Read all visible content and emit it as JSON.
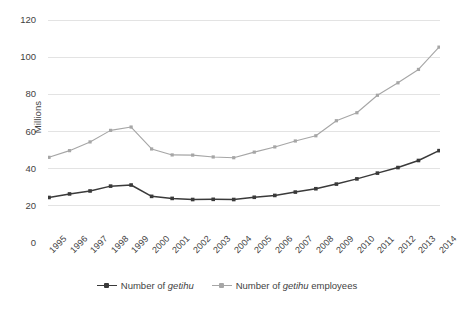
{
  "chart_data": {
    "type": "line",
    "title": "",
    "xlabel": "",
    "ylabel": "Millions",
    "ylim": [
      0,
      120
    ],
    "yticks": [
      0,
      20,
      40,
      60,
      80,
      100,
      120
    ],
    "grid": true,
    "legend_position": "bottom",
    "categories": [
      "1995",
      "1996",
      "1997",
      "1998",
      "1999",
      "2000",
      "2001",
      "2002",
      "2003",
      "2004",
      "2005",
      "2006",
      "2007",
      "2008",
      "2009",
      "2010",
      "2011",
      "2012",
      "2013",
      "2014"
    ],
    "series": [
      {
        "name": "Number of getihu",
        "name_html": "Number of <em>getihu</em>",
        "color": "#3a3a3a",
        "marker": "square",
        "values": [
          24.5,
          26.4,
          28.0,
          30.6,
          31.2,
          25.1,
          24.0,
          23.4,
          23.5,
          23.4,
          24.6,
          25.6,
          27.4,
          29.2,
          31.7,
          34.5,
          37.6,
          40.6,
          44.4,
          49.7
        ]
      },
      {
        "name": "Number of getihu employees",
        "name_html": "Number of <em>getihu</em> employees",
        "color": "#a6a6a6",
        "marker": "square",
        "values": [
          46.1,
          49.7,
          54.4,
          60.6,
          62.4,
          50.6,
          47.4,
          47.3,
          46.3,
          45.9,
          48.9,
          51.7,
          54.9,
          57.7,
          65.8,
          70.1,
          79.5,
          86.2,
          93.4,
          105.4
        ]
      }
    ]
  },
  "colors": {
    "series_dark": "#3a3a3a",
    "series_light": "#a6a6a6",
    "gridline": "#e3e3e3",
    "text": "#3f3f3f",
    "background": "#ffffff"
  }
}
